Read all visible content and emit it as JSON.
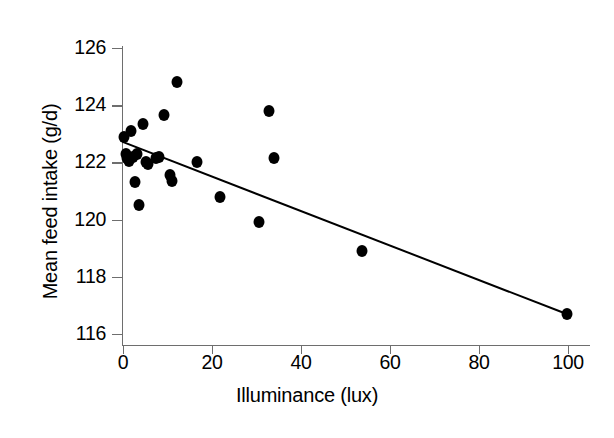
{
  "chart_data": {
    "type": "scatter",
    "title": "",
    "xlabel": "Illuminance (lux)",
    "ylabel": "Mean feed intake (g/d)",
    "xlim": [
      0,
      100
    ],
    "ylim": [
      116,
      126
    ],
    "xticks": [
      0,
      20,
      40,
      60,
      80,
      100
    ],
    "yticks": [
      116,
      118,
      120,
      122,
      124,
      126
    ],
    "xtick_labels": [
      "0",
      "20",
      "40",
      "60",
      "80",
      "100"
    ],
    "ytick_labels": [
      "116",
      "118",
      "120",
      "122",
      "124",
      "126"
    ],
    "grid": false,
    "legend": false,
    "marker": "filled-circle",
    "marker_color": "#000000",
    "line_color": "#000000",
    "axis_color": "#6e6e6e",
    "points": [
      {
        "x": 0.3,
        "y": 122.9
      },
      {
        "x": 0.6,
        "y": 122.3
      },
      {
        "x": 0.9,
        "y": 122.15
      },
      {
        "x": 1.3,
        "y": 122.05
      },
      {
        "x": 1.8,
        "y": 123.1
      },
      {
        "x": 2.2,
        "y": 122.2
      },
      {
        "x": 2.6,
        "y": 121.3
      },
      {
        "x": 3.1,
        "y": 122.3
      },
      {
        "x": 3.6,
        "y": 120.5
      },
      {
        "x": 4.4,
        "y": 123.35
      },
      {
        "x": 5.1,
        "y": 122.0
      },
      {
        "x": 5.6,
        "y": 121.95
      },
      {
        "x": 7.4,
        "y": 122.15
      },
      {
        "x": 8.2,
        "y": 122.2
      },
      {
        "x": 9.3,
        "y": 123.65
      },
      {
        "x": 10.6,
        "y": 121.55
      },
      {
        "x": 11.0,
        "y": 121.35
      },
      {
        "x": 12.2,
        "y": 124.8
      },
      {
        "x": 16.6,
        "y": 122.0
      },
      {
        "x": 21.8,
        "y": 120.8
      },
      {
        "x": 30.6,
        "y": 119.9
      },
      {
        "x": 32.7,
        "y": 123.8
      },
      {
        "x": 33.9,
        "y": 122.15
      },
      {
        "x": 53.8,
        "y": 118.9
      },
      {
        "x": 99.8,
        "y": 116.7
      }
    ],
    "trend_line": {
      "type": "linear-fit",
      "x_start": 0.0,
      "y_start": 122.75,
      "x_end": 100.0,
      "y_end": 116.72
    }
  }
}
